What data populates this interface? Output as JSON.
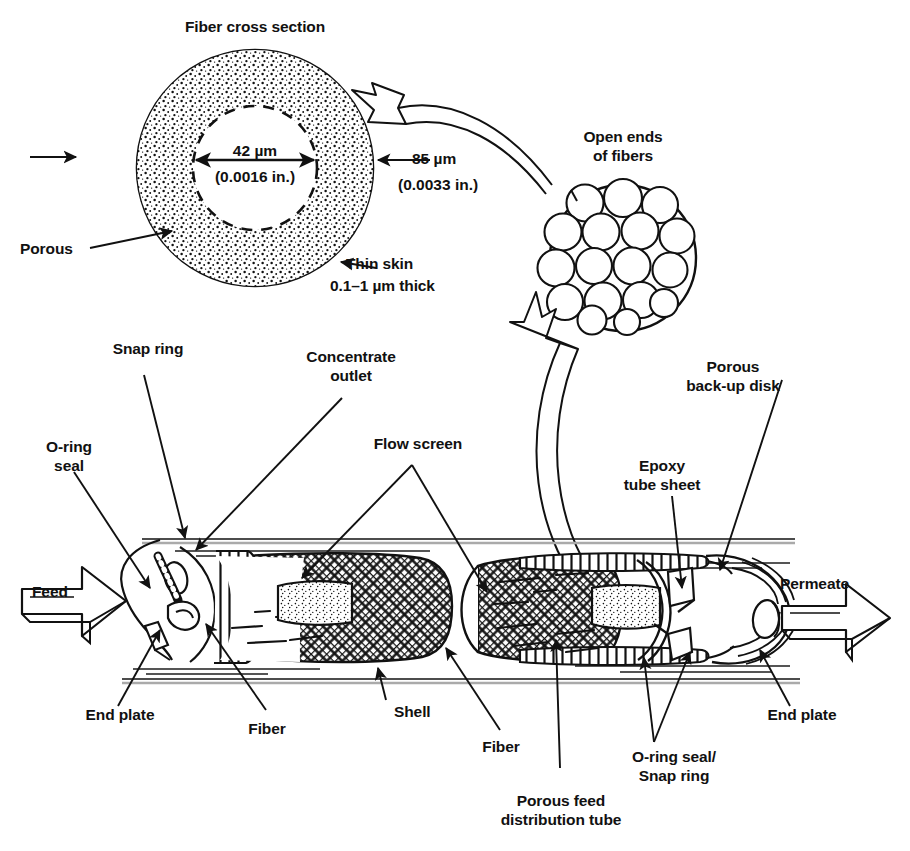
{
  "figure": {
    "title": "Fiber cross section",
    "type": "hollow-fiber membrane module cutaway diagram"
  },
  "cross_section": {
    "title": "Fiber cross section",
    "inner_diameter": "42 µm",
    "inner_diameter_inches": "(0.0016 in.)",
    "outer_diameter": "85 µm",
    "outer_diameter_inches": "(0.0033 in.)",
    "porous_label": "Porous",
    "skin_label": "Thin skin",
    "skin_thickness": "0.1–1 µm thick"
  },
  "bundle": {
    "label_line1": "Open ends",
    "label_line2": "of fibers"
  },
  "module": {
    "feed_label": "Feed",
    "permeate_label": "Permeate",
    "callouts": {
      "snap_ring": "Snap ring",
      "concentrate_outlet_line1": "Concentrate",
      "concentrate_outlet_line2": "outlet",
      "o_ring_seal_line1": "O-ring",
      "o_ring_seal_line2": "seal",
      "flow_screen": "Flow screen",
      "porous_backup_disk_line1": "Porous",
      "porous_backup_disk_line2": "back-up disk",
      "epoxy_tube_sheet_line1": "Epoxy",
      "epoxy_tube_sheet_line2": "tube sheet",
      "end_plate_left": "End plate",
      "end_plate_right": "End plate",
      "fiber_left": "Fiber",
      "fiber_right": "Fiber",
      "shell": "Shell",
      "porous_feed_tube_line1": "Porous feed",
      "porous_feed_tube_line2": "distribution tube",
      "oring_snapring_line1": "O-ring seal/",
      "oring_snapring_line2": "Snap ring"
    }
  },
  "colors": {
    "ink": "#111111",
    "paper": "#ffffff",
    "stipple": "#1a1a1a"
  }
}
